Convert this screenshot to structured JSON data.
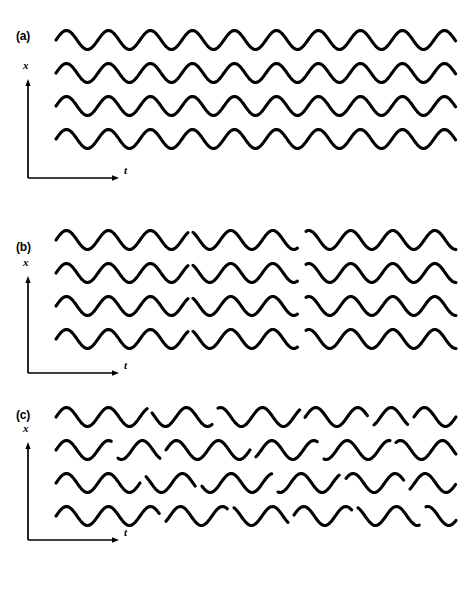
{
  "figure": {
    "background_color": "#ffffff",
    "ink_color": "#000000",
    "caption_text": "Figure",
    "caption_visible": false
  },
  "axes": {
    "x_label": "x",
    "t_label": "t",
    "x_axis_name": "vertical-displacement-axis",
    "t_axis_name": "time-axis"
  },
  "panels": [
    {
      "id": "a",
      "label": "(a)",
      "description": "four continuous coherent sine waves, no phase breaks",
      "break_count": 0
    },
    {
      "id": "b",
      "label": "(b)",
      "description": "four sine waves with two phase discontinuities each",
      "break_count": 2
    },
    {
      "id": "c",
      "label": "(c)",
      "description": "four sine waves with many random phase discontinuities",
      "break_count": 7
    }
  ],
  "chart_data": {
    "type": "line",
    "title": "",
    "subtitle": "",
    "xlabel": "t",
    "ylabel": "x",
    "grid": false,
    "legend": false,
    "panel_count": 3,
    "traces_per_panel": 4,
    "waveform": "sine",
    "period_px": 42,
    "amplitude_px": 9.5,
    "stroke_width_px": 3.1,
    "wave_start_x": 56,
    "wave_end_x": 456,
    "trace_spacing_px": 33,
    "panels": [
      {
        "id": "a",
        "label": "(a)",
        "axis_origin": [
          28,
          178
        ],
        "axis_top": [
          28,
          80
        ],
        "axis_right": [
          118,
          178
        ],
        "label_pos": [
          16,
          30
        ],
        "x_label_pos": [
          23,
          66
        ],
        "t_label_pos": [
          124,
          170
        ],
        "traces": [
          {
            "index": 0,
            "baseline_y": 40,
            "segments": [
              {
                "x0": 56,
                "x1": 456,
                "phase": 0.0
              }
            ]
          },
          {
            "index": 1,
            "baseline_y": 73,
            "segments": [
              {
                "x0": 56,
                "x1": 456,
                "phase": 0.0
              }
            ]
          },
          {
            "index": 2,
            "baseline_y": 106,
            "segments": [
              {
                "x0": 56,
                "x1": 456,
                "phase": 0.0
              }
            ]
          },
          {
            "index": 3,
            "baseline_y": 139,
            "segments": [
              {
                "x0": 56,
                "x1": 456,
                "phase": 0.0
              }
            ]
          }
        ]
      },
      {
        "id": "b",
        "label": "(b)",
        "axis_origin": [
          28,
          168
        ],
        "axis_top": [
          28,
          72
        ],
        "axis_right": [
          118,
          168
        ],
        "label_pos": [
          16,
          36
        ],
        "x_label_pos": [
          23,
          58
        ],
        "t_label_pos": [
          124,
          160
        ],
        "traces": [
          {
            "index": 0,
            "baseline_y": 35,
            "segments": [
              {
                "x0": 56,
                "x1": 188,
                "phase": 0.0
              },
              {
                "x0": 193,
                "x1": 298,
                "phase": 0.55
              },
              {
                "x0": 306,
                "x1": 456,
                "phase": 1.45
              }
            ]
          },
          {
            "index": 1,
            "baseline_y": 68,
            "segments": [
              {
                "x0": 56,
                "x1": 188,
                "phase": 0.0
              },
              {
                "x0": 193,
                "x1": 298,
                "phase": 0.55
              },
              {
                "x0": 306,
                "x1": 456,
                "phase": 1.45
              }
            ]
          },
          {
            "index": 2,
            "baseline_y": 101,
            "segments": [
              {
                "x0": 56,
                "x1": 188,
                "phase": 0.0
              },
              {
                "x0": 193,
                "x1": 298,
                "phase": 0.55
              },
              {
                "x0": 306,
                "x1": 456,
                "phase": 1.45
              }
            ]
          },
          {
            "index": 3,
            "baseline_y": 134,
            "segments": [
              {
                "x0": 56,
                "x1": 188,
                "phase": 0.0
              },
              {
                "x0": 193,
                "x1": 298,
                "phase": 0.55
              },
              {
                "x0": 306,
                "x1": 456,
                "phase": 1.45
              }
            ]
          }
        ]
      },
      {
        "id": "c",
        "label": "(c)",
        "axis_origin": [
          28,
          145
        ],
        "axis_top": [
          28,
          48
        ],
        "axis_right": [
          118,
          145
        ],
        "label_pos": [
          16,
          20
        ],
        "x_label_pos": [
          23,
          34
        ],
        "t_label_pos": [
          124,
          137
        ],
        "traces": [
          {
            "index": 0,
            "baseline_y": 22,
            "segments": [
              {
                "x0": 56,
                "x1": 148,
                "phase": 0.0
              },
              {
                "x0": 152,
                "x1": 212,
                "phase": 0.9
              },
              {
                "x0": 218,
                "x1": 300,
                "phase": 2.1
              },
              {
                "x0": 305,
                "x1": 368,
                "phase": 0.4
              },
              {
                "x0": 374,
                "x1": 408,
                "phase": 1.7
              },
              {
                "x0": 414,
                "x1": 456,
                "phase": 3.0
              }
            ]
          },
          {
            "index": 1,
            "baseline_y": 55,
            "segments": [
              {
                "x0": 56,
                "x1": 112,
                "phase": 0.0
              },
              {
                "x0": 118,
                "x1": 160,
                "phase": 1.2
              },
              {
                "x0": 166,
                "x1": 250,
                "phase": 2.4
              },
              {
                "x0": 256,
                "x1": 318,
                "phase": 0.7
              },
              {
                "x0": 324,
                "x1": 390,
                "phase": 2.0
              },
              {
                "x0": 396,
                "x1": 456,
                "phase": 0.3
              }
            ]
          },
          {
            "index": 2,
            "baseline_y": 88,
            "segments": [
              {
                "x0": 56,
                "x1": 140,
                "phase": 0.0
              },
              {
                "x0": 146,
                "x1": 196,
                "phase": 1.5
              },
              {
                "x0": 202,
                "x1": 272,
                "phase": 0.5
              },
              {
                "x0": 278,
                "x1": 340,
                "phase": 2.6
              },
              {
                "x0": 346,
                "x1": 404,
                "phase": 1.1
              },
              {
                "x0": 410,
                "x1": 456,
                "phase": 2.9
              }
            ]
          },
          {
            "index": 3,
            "baseline_y": 121,
            "segments": [
              {
                "x0": 56,
                "x1": 160,
                "phase": 0.0
              },
              {
                "x0": 166,
                "x1": 228,
                "phase": 1.8
              },
              {
                "x0": 234,
                "x1": 288,
                "phase": 0.6
              },
              {
                "x0": 294,
                "x1": 352,
                "phase": 2.2
              },
              {
                "x0": 358,
                "x1": 420,
                "phase": 0.9
              },
              {
                "x0": 426,
                "x1": 456,
                "phase": 2.5
              }
            ]
          }
        ]
      }
    ]
  }
}
